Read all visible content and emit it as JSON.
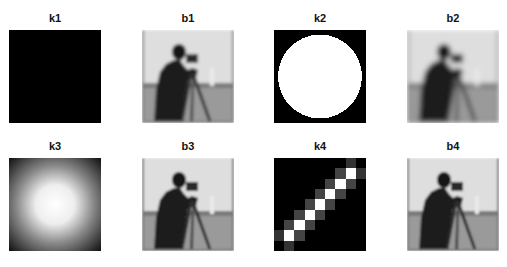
{
  "figure": {
    "panels": [
      {
        "id": "k1",
        "title": "k1",
        "kind": "kernel-uniform"
      },
      {
        "id": "b1",
        "title": "b1",
        "kind": "blurred-image"
      },
      {
        "id": "k2",
        "title": "k2",
        "kind": "kernel-disk"
      },
      {
        "id": "b2",
        "title": "b2",
        "kind": "blurred-image"
      },
      {
        "id": "k3",
        "title": "k3",
        "kind": "kernel-gaussian"
      },
      {
        "id": "b3",
        "title": "b3",
        "kind": "blurred-image"
      },
      {
        "id": "k4",
        "title": "k4",
        "kind": "kernel-motion"
      },
      {
        "id": "b4",
        "title": "b4",
        "kind": "blurred-image"
      }
    ]
  }
}
